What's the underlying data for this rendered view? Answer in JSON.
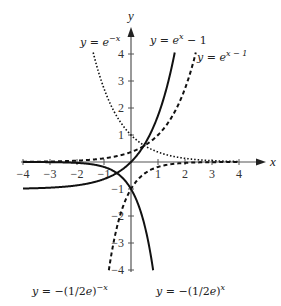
{
  "chart_data": {
    "type": "line",
    "title": "",
    "xlabel": "x",
    "ylabel": "y",
    "xlim": [
      -4,
      4
    ],
    "ylim": [
      -4,
      4
    ],
    "x_ticks": [
      -4,
      -3,
      -2,
      -1,
      1,
      2,
      3,
      4
    ],
    "y_ticks": [
      -4,
      -3,
      -2,
      -1,
      1,
      2,
      3,
      4
    ],
    "grid": false,
    "series": [
      {
        "name": "y = e^{-x}",
        "style": "dotted",
        "expr": "exp(-x)",
        "label_pos": [
          80,
          34
        ]
      },
      {
        "name": "y = e^{x} - 1",
        "style": "solid",
        "expr": "exp(x)-1",
        "label_pos": [
          150,
          32
        ]
      },
      {
        "name": "y = e^{x-1}",
        "style": "dashed",
        "expr": "exp(x-1)",
        "label_pos": [
          197,
          49
        ]
      },
      {
        "name": "y = -(1/2e)^{-x}",
        "style": "solid",
        "expr": "-pow(1/(2*Math.E), -x)",
        "label_pos": [
          32,
          283
        ]
      },
      {
        "name": "y = -(1/2e)^{x}",
        "style": "dashed",
        "expr": "-pow(1/(2*Math.E), x)",
        "label_pos": [
          156,
          283
        ]
      }
    ],
    "labels": {
      "e_neg_x": {
        "pre": "y = e",
        "sup": "−x"
      },
      "e_x_minus_1": {
        "pre": "y = e",
        "sup": "x",
        "post": " − 1"
      },
      "e_x_minus_1_shift": {
        "pre": "y = e",
        "sup": "x − 1"
      },
      "neg_half_e_neg_x": {
        "pre": "y = −(1/2e)",
        "sup": "−x"
      },
      "neg_half_e_x": {
        "pre": "y = −(1/2e)",
        "sup": "x"
      }
    }
  }
}
